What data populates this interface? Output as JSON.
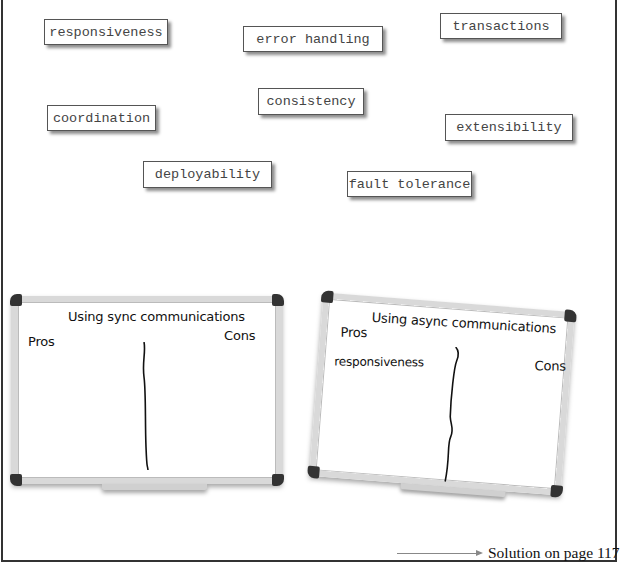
{
  "notes": [
    {
      "id": "responsiveness",
      "label": "responsiveness"
    },
    {
      "id": "error-handling",
      "label": "error handling"
    },
    {
      "id": "transactions",
      "label": "transactions"
    },
    {
      "id": "consistency",
      "label": "consistency"
    },
    {
      "id": "coordination",
      "label": "coordination"
    },
    {
      "id": "extensibility",
      "label": "extensibility"
    },
    {
      "id": "deployability",
      "label": "deployability"
    },
    {
      "id": "fault-tolerance",
      "label": "fault tolerance"
    }
  ],
  "boards": {
    "sync": {
      "title": "Using sync communications",
      "pros_label": "Pros",
      "cons_label": "Cons",
      "pros_items": [],
      "cons_items": []
    },
    "async": {
      "title": "Using async communications",
      "pros_label": "Pros",
      "cons_label": "Cons",
      "pros_items": [
        "responsiveness"
      ],
      "cons_items": []
    }
  },
  "footer": {
    "solution_text": "Solution on page 117"
  }
}
